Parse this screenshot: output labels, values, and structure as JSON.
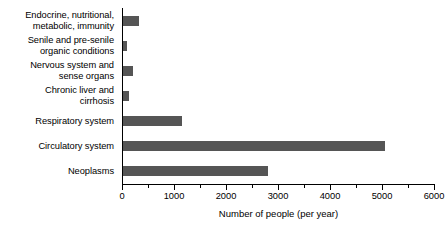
{
  "chart_data": {
    "type": "bar",
    "orientation": "horizontal",
    "title": "",
    "xlabel": "Number of people (per year)",
    "ylabel": "",
    "xlim": [
      0,
      6000
    ],
    "xticks": [
      0,
      1000,
      2000,
      3000,
      4000,
      5000,
      6000
    ],
    "xtick_labels": [
      "0",
      "1000",
      "2000",
      "3000",
      "4000",
      "5000",
      "6000"
    ],
    "minor_tick_step": 500,
    "grid": false,
    "legend": null,
    "bar_color": "#555555",
    "axis_color": "#000000",
    "categories": [
      "Endocrine, nutritional,\nmetabolic, immunity",
      "Senile and pre-senile\norganic conditions",
      "Nervous system and\nsense organs",
      "Chronic liver and\ncirrhosis",
      "Respiratory system",
      "Circulatory system",
      "Neoplasms"
    ],
    "values": [
      330,
      100,
      210,
      130,
      1150,
      5050,
      2800
    ]
  }
}
